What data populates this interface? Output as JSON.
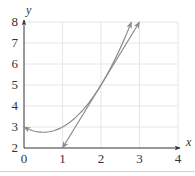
{
  "chart_data": {
    "type": "line",
    "title": "",
    "xlabel": "x",
    "ylabel": "y",
    "xlim": [
      0,
      4
    ],
    "ylim": [
      2,
      8
    ],
    "xticks": [
      "0",
      "1",
      "2",
      "3",
      "4"
    ],
    "yticks": [
      "2",
      "3",
      "4",
      "5",
      "6",
      "7",
      "8"
    ],
    "grid": true,
    "legend": null,
    "series": [
      {
        "name": "curve",
        "description": "parabola y = x^2 - x + 3, arrows at both ends",
        "x": [
          0,
          0.5,
          1,
          1.5,
          2,
          2.5,
          2.79
        ],
        "values": [
          3,
          2.75,
          3,
          3.75,
          5,
          6.75,
          8
        ]
      },
      {
        "name": "tangent line at x=2",
        "description": "y = 3x - 1, arrows at both ends",
        "x": [
          1,
          2,
          3
        ],
        "values": [
          2,
          5,
          8
        ]
      }
    ],
    "annotations": [
      {
        "type": "point-of-tangency",
        "x": 2,
        "y": 5
      }
    ]
  },
  "style": {
    "curve_color": "#8a8a8a",
    "axis_color": "#333333",
    "grid_color": "#e6e6e6"
  }
}
